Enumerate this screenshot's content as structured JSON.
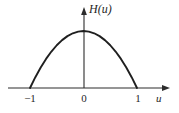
{
  "figure": {
    "kind": "math-plot",
    "background_color": "#ffffff",
    "ink_color": "#1f1f1f",
    "axis_color": "#2c2c2c"
  },
  "axes": {
    "vertical": {
      "name": "H(u)",
      "label": "H(u)",
      "arrow": "up",
      "x_px": 84,
      "top_px": 8,
      "bottom_px": 88
    },
    "horizontal": {
      "name": "u",
      "label": "u",
      "arrow": "right",
      "y_px": 88,
      "left_px": 8,
      "right_px": 170
    }
  },
  "ticks": {
    "x": [
      {
        "label": "−1",
        "value": -1
      },
      {
        "label": "0",
        "value": 0
      },
      {
        "label": "1",
        "value": 1
      }
    ]
  },
  "chart_data": {
    "type": "line",
    "title": "",
    "xlabel": "u",
    "ylabel": "H(u)",
    "xlim": [
      -1.45,
      1.45
    ],
    "ylim": [
      0,
      1.12
    ],
    "grid": false,
    "legend": null,
    "xticks": [
      -1,
      0,
      1
    ],
    "xticklabels": [
      "−1",
      "0",
      "1"
    ],
    "yticks": [],
    "yticklabels": [],
    "annotations": [],
    "series": [
      {
        "name": "H(u)",
        "expression": "1 - u^2",
        "color": "#1f1f1f",
        "x": [
          -1,
          -0.9,
          -0.8,
          -0.7,
          -0.6,
          -0.5,
          -0.4,
          -0.3,
          -0.2,
          -0.1,
          0,
          0.1,
          0.2,
          0.3,
          0.4,
          0.5,
          0.6,
          0.7,
          0.8,
          0.9,
          1
        ],
        "values": [
          0,
          0.19,
          0.36,
          0.51,
          0.64,
          0.75,
          0.84,
          0.91,
          0.96,
          0.99,
          1,
          0.99,
          0.96,
          0.91,
          0.84,
          0.75,
          0.64,
          0.51,
          0.36,
          0.19,
          0
        ]
      }
    ]
  },
  "geometry": {
    "curve_left_root_px": 30,
    "curve_right_root_px": 137,
    "curve_apex_px": {
      "x": 84,
      "y": 31
    }
  }
}
